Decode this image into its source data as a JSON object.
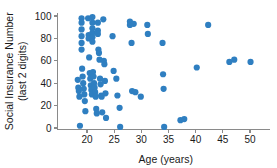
{
  "chart_data": {
    "type": "scatter",
    "title": "",
    "xlabel": "Age (years)",
    "ylabel": "Social Insurance Number (last 2 digits)",
    "ylabel_line1": "Social Insurance Number",
    "ylabel_line2": "(last 2 digits)",
    "xlim": [
      17.0,
      51.5
    ],
    "ylim": [
      -4,
      103
    ],
    "xticks": [
      20,
      25,
      30,
      35,
      40,
      45,
      50
    ],
    "xticklabels": [
      "20",
      "25",
      "30",
      "35",
      "40",
      "45",
      "50"
    ],
    "yticks": [
      0,
      20,
      40,
      60,
      80,
      100
    ],
    "yticklabels": [
      "0",
      "20",
      "40",
      "60",
      "80",
      "100"
    ],
    "grid": false,
    "legend": null,
    "marker_color": "#2f7fc1",
    "marker_size": 3.1,
    "axis_color": "#8a8a8a",
    "points": [
      [
        18.3,
        43
      ],
      [
        18.4,
        36
      ],
      [
        18.5,
        33
      ],
      [
        18.6,
        28
      ],
      [
        18.7,
        2
      ],
      [
        19.0,
        98
      ],
      [
        19.0,
        94
      ],
      [
        19.0,
        88
      ],
      [
        19.0,
        82
      ],
      [
        19.0,
        76
      ],
      [
        19.0,
        70
      ],
      [
        19.1,
        53
      ],
      [
        19.2,
        46
      ],
      [
        19.3,
        40
      ],
      [
        19.4,
        35
      ],
      [
        19.5,
        30
      ],
      [
        19.6,
        24
      ],
      [
        19.7,
        15
      ],
      [
        20.2,
        98
      ],
      [
        20.3,
        83
      ],
      [
        20.3,
        80
      ],
      [
        20.4,
        63
      ],
      [
        20.5,
        49
      ],
      [
        20.6,
        44
      ],
      [
        20.7,
        38
      ],
      [
        20.8,
        34
      ],
      [
        20.9,
        30
      ],
      [
        21.0,
        99
      ],
      [
        21.0,
        94
      ],
      [
        21.0,
        89
      ],
      [
        21.0,
        85
      ],
      [
        21.0,
        81
      ],
      [
        21.0,
        77
      ],
      [
        21.1,
        50
      ],
      [
        21.2,
        46
      ],
      [
        21.3,
        40
      ],
      [
        21.4,
        36
      ],
      [
        21.5,
        32
      ],
      [
        21.6,
        28
      ],
      [
        21.7,
        17
      ],
      [
        21.8,
        13
      ],
      [
        22.0,
        94
      ],
      [
        22.0,
        87
      ],
      [
        22.0,
        84
      ],
      [
        22.1,
        70
      ],
      [
        22.2,
        67
      ],
      [
        22.3,
        61
      ],
      [
        22.4,
        44
      ],
      [
        22.5,
        39
      ],
      [
        22.6,
        29
      ],
      [
        22.7,
        28
      ],
      [
        22.8,
        14
      ],
      [
        23.0,
        97
      ],
      [
        23.1,
        60
      ],
      [
        23.2,
        57
      ],
      [
        23.3,
        42
      ],
      [
        23.4,
        31
      ],
      [
        23.5,
        9
      ],
      [
        24.7,
        82
      ],
      [
        24.9,
        51
      ],
      [
        25.4,
        44
      ],
      [
        25.6,
        29
      ],
      [
        26.0,
        18
      ],
      [
        26.1,
        1
      ],
      [
        27.9,
        95
      ],
      [
        27.9,
        92
      ],
      [
        28.2,
        76
      ],
      [
        28.3,
        33
      ],
      [
        28.6,
        93
      ],
      [
        28.9,
        32
      ],
      [
        29.9,
        28
      ],
      [
        31.1,
        92
      ],
      [
        31.2,
        84
      ],
      [
        33.9,
        76
      ],
      [
        34.0,
        48
      ],
      [
        34.1,
        35
      ],
      [
        34.2,
        1
      ],
      [
        37.2,
        7
      ],
      [
        37.9,
        8
      ],
      [
        40.2,
        54
      ],
      [
        42.3,
        92
      ],
      [
        46.2,
        59
      ],
      [
        47.1,
        61
      ],
      [
        50.1,
        59
      ]
    ]
  }
}
